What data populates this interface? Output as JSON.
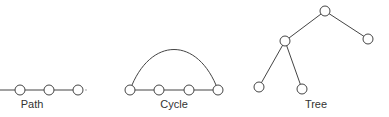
{
  "diagrams": [
    {
      "id": "path",
      "label": "Path",
      "label_pos": [
        32,
        98
      ],
      "nodes": [
        [
          20,
          90
        ],
        [
          49,
          90
        ],
        [
          78,
          90
        ]
      ],
      "edges": [
        [
          [
            0,
            90
          ],
          [
            20,
            90
          ]
        ],
        [
          0,
          1
        ],
        [
          1,
          2
        ]
      ],
      "trailing_dot": [
        86,
        90
      ]
    },
    {
      "id": "cycle",
      "label": "Cycle",
      "label_pos": [
        174,
        98
      ],
      "nodes": [
        [
          130,
          90
        ],
        [
          159,
          90
        ],
        [
          189,
          90
        ],
        [
          218,
          90
        ]
      ],
      "edges": [
        [
          0,
          1
        ],
        [
          1,
          2
        ],
        [
          2,
          3
        ]
      ],
      "arc": {
        "from": 0,
        "to": 3,
        "peak_y": 54
      }
    },
    {
      "id": "tree",
      "label": "Tree",
      "label_pos": [
        316,
        98
      ],
      "nodes": [
        [
          325,
          11
        ],
        [
          285,
          41
        ],
        [
          368,
          39
        ],
        [
          259,
          87
        ],
        [
          302,
          89
        ]
      ],
      "edges": [
        [
          0,
          1
        ],
        [
          0,
          2
        ],
        [
          1,
          3
        ],
        [
          1,
          4
        ]
      ]
    }
  ],
  "style": {
    "stroke": "#444444",
    "node_radius": 5
  }
}
